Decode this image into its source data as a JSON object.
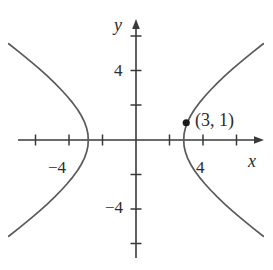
{
  "figure": {
    "name": "hyperbola-graph",
    "width": 273,
    "height": 270,
    "background_color": "#ffffff",
    "curve_color": "#5a5a5a",
    "axis_color": "#3a3a3a",
    "text_color": "#2b2b2b"
  },
  "axes": {
    "x_label": "x",
    "y_label": "y",
    "x_tick_labels": [
      "-4",
      "4"
    ],
    "y_tick_labels": [
      "4",
      "-4"
    ],
    "x_tick_negative": "−4",
    "x_tick_positive": "4",
    "y_tick_positive": "4",
    "y_tick_negative": "−4"
  },
  "annotations": {
    "point_label": "(3, 1)"
  },
  "chart_data": {
    "type": "line",
    "title": "",
    "xlabel": "x",
    "ylabel": "y",
    "grid": false,
    "legend": null,
    "xlim": [
      -7,
      8
    ],
    "ylim": [
      -7,
      7
    ],
    "x_ticks": [
      -6,
      -4,
      -2,
      0,
      2,
      4,
      6
    ],
    "y_ticks": [
      -6,
      -4,
      -2,
      0,
      2,
      4,
      6
    ],
    "x_tick_labels": {
      "-4": "−4",
      "4": "4"
    },
    "y_tick_labels": {
      "4": "4",
      "-4": "−4"
    },
    "curve": {
      "name": "hyperbola",
      "equation": "x^2/8 - y^2/1 = 1",
      "orientation": "horizontal",
      "vertices": [
        [
          -2.85,
          0
        ],
        [
          2.85,
          0
        ]
      ],
      "right_branch": [
        [
          2.85,
          0.0
        ],
        [
          2.87,
          0.35
        ],
        [
          2.95,
          0.7
        ],
        [
          3.08,
          1.05
        ],
        [
          3.27,
          1.42
        ],
        [
          3.5,
          1.78
        ],
        [
          3.78,
          2.15
        ],
        [
          4.1,
          2.52
        ],
        [
          4.45,
          2.9
        ],
        [
          4.85,
          3.3
        ],
        [
          5.3,
          3.72
        ],
        [
          5.8,
          4.15
        ],
        [
          6.35,
          4.6
        ],
        [
          6.95,
          5.08
        ],
        [
          7.6,
          5.58
        ]
      ],
      "left_branch": [
        [
          -2.85,
          0.0
        ],
        [
          -2.87,
          0.35
        ],
        [
          -2.95,
          0.7
        ],
        [
          -3.08,
          1.05
        ],
        [
          -3.27,
          1.42
        ],
        [
          -3.5,
          1.78
        ],
        [
          -3.78,
          2.15
        ],
        [
          -4.1,
          2.52
        ],
        [
          -4.45,
          2.9
        ],
        [
          -4.85,
          3.3
        ],
        [
          -5.3,
          3.72
        ],
        [
          -5.8,
          4.15
        ],
        [
          -6.35,
          4.6
        ],
        [
          -6.95,
          5.08
        ],
        [
          -7.6,
          5.58
        ]
      ]
    },
    "points": [
      {
        "x": 3,
        "y": 1,
        "label": "(3, 1)",
        "marker": "filled-circle"
      }
    ]
  }
}
